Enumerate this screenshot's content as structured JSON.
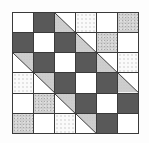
{
  "colors": {
    "white": "#ffffff",
    "dark": "#595959",
    "dotted": "#cfcfcf",
    "faint": "#fafafa",
    "grid_line": "#3a3a3a"
  },
  "legend": {
    "white": "plain white square",
    "dark": "solid dark gray square",
    "dotted": "speckled light gray square",
    "faint": "white square with faint print",
    "tri-ll": "half-square triangle, diagonal top-left to bottom-right, lower-left speckled gray, upper-right white",
    "tri-ur": "half-square triangle, diagonal top-left to bottom-right, upper-right speckled gray, lower-left white"
  },
  "grid": {
    "rows": 6,
    "cols": 6,
    "cells": [
      [
        "white",
        "dark",
        "tri-ll",
        "faint",
        "white",
        "dotted"
      ],
      [
        "dark",
        "white",
        "dark",
        "tri-ll",
        "dotted",
        "white"
      ],
      [
        "tri-ur",
        "dark",
        "white",
        "dark",
        "tri-ll",
        "faint"
      ],
      [
        "faint",
        "tri-ur",
        "dark",
        "white",
        "dark",
        "tri-ll"
      ],
      [
        "white",
        "dotted",
        "tri-ur",
        "dark",
        "white",
        "dark"
      ],
      [
        "dotted",
        "white",
        "faint",
        "tri-ur",
        "dark",
        "white"
      ]
    ]
  }
}
